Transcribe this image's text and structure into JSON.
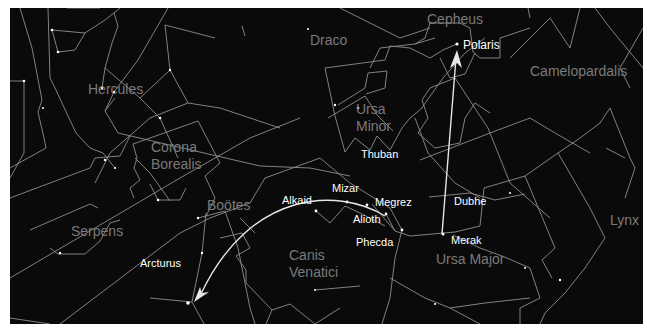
{
  "chart": {
    "background": "#0a0a0a",
    "line_color": "#9a9a9a",
    "arrow_color": "#e6e6e6",
    "constellation_label_color": "#7a7a7a",
    "star_label_color": "#ffffff"
  },
  "constellations": [
    {
      "id": "hercules",
      "label": "Hercules",
      "x": 78,
      "y": 73
    },
    {
      "id": "draco",
      "label": "Draco",
      "x": 300,
      "y": 26
    },
    {
      "id": "cepheus",
      "label": "Cepheus",
      "x": 418,
      "y": 4
    },
    {
      "id": "camelopardalis",
      "label": "Camelopardalis",
      "x": 520,
      "y": 57
    },
    {
      "id": "ursa-minor-1",
      "label": "Ursa",
      "x": 345,
      "y": 95
    },
    {
      "id": "ursa-minor-2",
      "label": "Minor",
      "x": 345,
      "y": 112
    },
    {
      "id": "corona-borealis-1",
      "label": "Corona",
      "x": 140,
      "y": 132
    },
    {
      "id": "corona-borealis-2",
      "label": "Borealis",
      "x": 140,
      "y": 149
    },
    {
      "id": "bootes",
      "label": "Boötes",
      "x": 197,
      "y": 191
    },
    {
      "id": "serpens",
      "label": "Serpens",
      "x": 60,
      "y": 216
    },
    {
      "id": "canis-venatici-1",
      "label": "Canis",
      "x": 279,
      "y": 240
    },
    {
      "id": "canis-venatici-2",
      "label": "Venatici",
      "x": 279,
      "y": 257
    },
    {
      "id": "ursa-major",
      "label": "Ursa Major",
      "x": 425,
      "y": 244
    },
    {
      "id": "lynx",
      "label": "Lynx",
      "x": 599,
      "y": 205
    }
  ],
  "stars": [
    {
      "id": "polaris",
      "label": "Polaris",
      "x": 447,
      "y": 36,
      "lx": 452,
      "ly": 30
    },
    {
      "id": "thuban",
      "label": "Thuban",
      "x": 0,
      "y": 0,
      "lx": 351,
      "ly": 141
    },
    {
      "id": "mizar",
      "label": "Mizar",
      "x": 337,
      "y": 194,
      "lx": 322,
      "ly": 174
    },
    {
      "id": "alkaid",
      "label": "Alkaid",
      "x": 306,
      "y": 203,
      "lx": 272,
      "ly": 186
    },
    {
      "id": "megrez",
      "label": "Megrez",
      "x": 357,
      "y": 197,
      "lx": 365,
      "ly": 189
    },
    {
      "id": "alioth",
      "label": "Alioth",
      "x": 376,
      "y": 206,
      "lx": 343,
      "ly": 206
    },
    {
      "id": "dubhe",
      "label": "Dubhe",
      "x": 430,
      "y": 192,
      "lx": 444,
      "ly": 188
    },
    {
      "id": "phecda",
      "label": "Phecda",
      "x": 392,
      "y": 222,
      "lx": 346,
      "ly": 230
    },
    {
      "id": "merak",
      "label": "Merak",
      "x": 433,
      "y": 226,
      "lx": 441,
      "ly": 227
    },
    {
      "id": "arcturus",
      "label": "Arcturus",
      "x": 178,
      "y": 295,
      "lx": 130,
      "ly": 250
    }
  ]
}
